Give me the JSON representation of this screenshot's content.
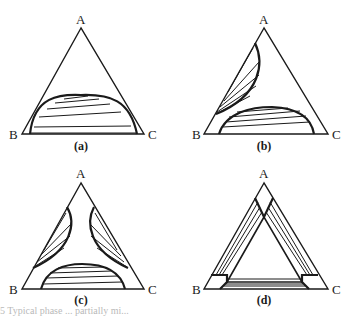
{
  "figure": {
    "panels": [
      {
        "id": "a",
        "caption": "(a)",
        "vertices": {
          "top": "A",
          "left": "B",
          "right": "C"
        },
        "description": "One binodal region on the B-C side with tie lines"
      },
      {
        "id": "b",
        "caption": "(b)",
        "vertices": {
          "top": "A",
          "left": "B",
          "right": "C"
        },
        "description": "Two binodal regions: along A-B side and B-C side"
      },
      {
        "id": "c",
        "caption": "(c)",
        "vertices": {
          "top": "A",
          "left": "B",
          "right": "C"
        },
        "description": "Three binodal regions, one along each side"
      },
      {
        "id": "d",
        "caption": "(d)",
        "vertices": {
          "top": "A",
          "left": "B",
          "right": "C"
        },
        "description": "Three overlapping two-phase bands along each side with central three-phase triangle"
      }
    ],
    "caption_partial": "5 Typical phase ... partially mi..."
  },
  "colors": {
    "line": "#1a1a1a",
    "background": "#ffffff"
  }
}
